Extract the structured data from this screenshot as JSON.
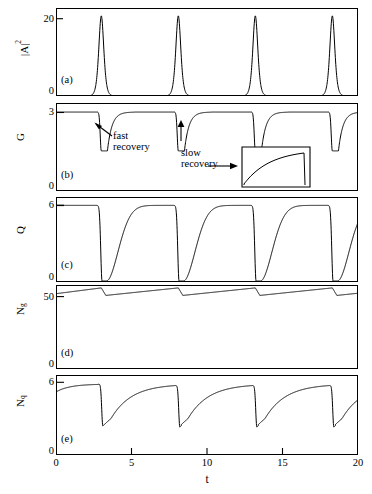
{
  "figure": {
    "panel_tags": [
      "(a)",
      "(b)",
      "(c)",
      "(d)",
      "(e)"
    ],
    "xaxis": {
      "title": "t",
      "ticks": [
        0,
        5,
        10,
        15,
        20
      ],
      "tick_labels": [
        "0",
        "5",
        "10",
        "15",
        "20"
      ],
      "range": [
        0,
        20
      ]
    },
    "annotations": {
      "fast_recovery_line1": "fast",
      "fast_recovery_line2": "recovery",
      "slow_recovery_line1": "slow",
      "slow_recovery_line2": "recovery"
    },
    "colors": {
      "curve": "#000000",
      "frame": "#000000",
      "background": "#ffffff"
    }
  },
  "chart_data": [
    {
      "type": "line",
      "panel": "(a)",
      "ylabel": "|A|^2",
      "ylabel_base": "|A|",
      "ylabel_exp": "2",
      "ytick_labels": [
        "0",
        "20"
      ],
      "yticks": [
        0,
        20
      ],
      "ylim": [
        0,
        28
      ],
      "xlabel": "",
      "xlim": [
        0,
        20
      ],
      "grid": false,
      "description": "Four narrow tall intensity pulses of pulsed laser output",
      "pulse_peak_times": [
        3.0,
        8.1,
        13.2,
        18.3
      ],
      "pulse_peak_value": 25.5,
      "pulse_baseline": 0,
      "pulse_halfwidth": 0.22,
      "period": 5.1
    },
    {
      "type": "line",
      "panel": "(b)",
      "ylabel": "G",
      "ytick_labels": [
        "0",
        "3"
      ],
      "yticks": [
        0,
        3
      ],
      "ylim": [
        0,
        3.4
      ],
      "xlim": [
        0,
        20
      ],
      "grid": false,
      "description": "Gain G dips sharply at each pulse then recovers",
      "baseline": 3.05,
      "dip_times": [
        3.0,
        8.1,
        13.2,
        18.3
      ],
      "dip_min_value": 1.55,
      "dip_width": 0.45,
      "inset": {
        "x_range": [
          14.6,
          18.6
        ],
        "y_range": [
          0.0,
          1.6
        ],
        "description": "magnified view of slow gain recovery ramp"
      }
    },
    {
      "type": "line",
      "panel": "(c)",
      "ylabel": "Q",
      "ytick_labels": [
        "0",
        "6"
      ],
      "yticks": [
        0,
        6
      ],
      "ylim": [
        0,
        6.6
      ],
      "xlim": [
        0,
        20
      ],
      "grid": false,
      "description": "Loss Q drops to zero at each pulse then saturates back to 6",
      "baseline": 5.95,
      "dip_times": [
        3.05,
        8.15,
        13.25,
        18.35
      ],
      "dip_min_value": 0.08,
      "recovery_time_constant": 1.1
    },
    {
      "type": "line",
      "panel": "(d)",
      "ylabel": "Ng",
      "ylabel_base": "N",
      "ylabel_sub": "g",
      "ytick_labels": [
        "0",
        "50"
      ],
      "yticks": [
        0,
        50
      ],
      "ylim": [
        0,
        58
      ],
      "xlim": [
        0,
        20
      ],
      "grid": false,
      "description": "Gain carrier number Ng sawtooth: slow linear rise, fast drop at each pulse",
      "sawtooth_max": 56.0,
      "sawtooth_min": 50.8,
      "drop_times": [
        3.0,
        8.1,
        13.2,
        18.3
      ],
      "start_value": 52.0
    },
    {
      "type": "line",
      "panel": "(e)",
      "ylabel": "Nq",
      "ylabel_base": "N",
      "ylabel_sub": "q",
      "ytick_labels": [
        "0",
        "6"
      ],
      "yticks": [
        0,
        6
      ],
      "ylim": [
        0,
        6.6
      ],
      "xlim": [
        0,
        20
      ],
      "grid": false,
      "description": "Absorber carrier number Nq drops at each pulse and relaxes back toward 6",
      "baseline": 5.85,
      "dip_times": [
        3.1,
        8.2,
        13.3,
        18.4
      ],
      "dip_min_value": 2.4,
      "start_value": 5.2
    }
  ]
}
